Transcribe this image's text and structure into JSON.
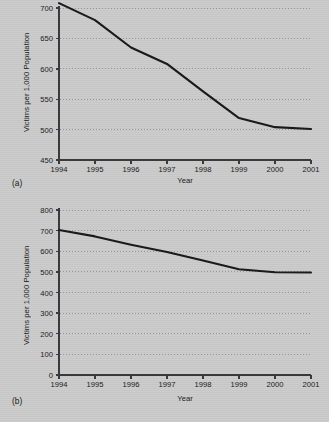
{
  "figure": {
    "background_color": "#cacaca",
    "line_color": "#1a1a1a",
    "grid_color": "#8f8f8f",
    "axis_color": "#3a3a3a"
  },
  "chart_data": [
    {
      "id": "a",
      "type": "line",
      "panel_label": "(a)",
      "title": "",
      "xlabel": "Year",
      "ylabel": "Victims per 1,000 Population",
      "categories": [
        "1994",
        "1995",
        "1996",
        "1997",
        "1998",
        "1999",
        "2000",
        "2001"
      ],
      "x": [
        1994,
        1995,
        1996,
        1997,
        1998,
        1999,
        2000,
        2001
      ],
      "values": [
        708,
        680,
        635,
        608,
        563,
        519,
        504,
        501
      ],
      "xlim": [
        1994,
        2001
      ],
      "ylim": [
        450,
        700
      ],
      "yticks": [
        450,
        500,
        550,
        600,
        650,
        700
      ],
      "xticks": [
        "1994",
        "1995",
        "1996",
        "1997",
        "1998",
        "1999",
        "2000",
        "2001"
      ],
      "grid": true,
      "grid_style": "dotted-horizontal",
      "legend": null
    },
    {
      "id": "b",
      "type": "line",
      "panel_label": "(b)",
      "title": "",
      "xlabel": "Year",
      "ylabel": "Victims per 1,000 Population",
      "categories": [
        "1994",
        "1995",
        "1996",
        "1997",
        "1998",
        "1999",
        "2000",
        "2001"
      ],
      "x": [
        1994,
        1995,
        1996,
        1997,
        1998,
        1999,
        2000,
        2001
      ],
      "values": [
        703,
        672,
        632,
        596,
        555,
        513,
        498,
        497
      ],
      "xlim": [
        1994,
        2001
      ],
      "ylim": [
        0,
        800
      ],
      "yticks": [
        0,
        100,
        200,
        300,
        400,
        500,
        600,
        700,
        800
      ],
      "xticks": [
        "1994",
        "1995",
        "1996",
        "1997",
        "1998",
        "1999",
        "2000",
        "2001"
      ],
      "grid": true,
      "grid_style": "dotted-horizontal",
      "legend": null
    }
  ]
}
